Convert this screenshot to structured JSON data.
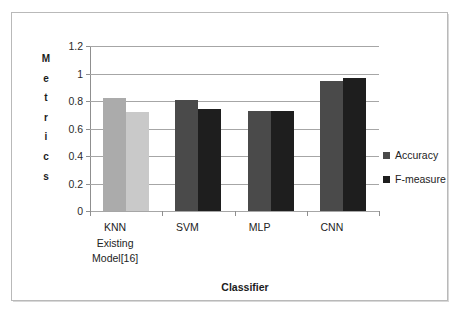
{
  "chart_data": {
    "type": "bar",
    "title": "",
    "xlabel": "Classifier",
    "ylabel": "Metrics",
    "categories": [
      "KNN\nExisting\nModel[16]",
      "SVM",
      "MLP",
      "CNN"
    ],
    "series": [
      {
        "name": "Accuracy",
        "values": [
          0.82,
          0.805,
          0.73,
          0.945
        ]
      },
      {
        "name": "F-measure",
        "values": [
          0.72,
          0.745,
          0.73,
          0.965
        ]
      }
    ],
    "ylim": [
      0,
      1.2
    ],
    "ytick_labels": [
      "0",
      "0.2",
      "0.4",
      "0.6",
      "0.8",
      "1",
      "1.2"
    ],
    "ytick_values": [
      0,
      0.2,
      0.4,
      0.6,
      0.8,
      1,
      1.2
    ],
    "grid": true,
    "legend_position": "right",
    "bar_colors": {
      "knn_accuracy": "#ABABAB",
      "knn_fmeasure": "#C9C9C9",
      "accuracy": "#4A4A4A",
      "fmeasure": "#1E1E1E"
    },
    "legend_swatch_colors": [
      "#4A4A4A",
      "#1E1E1E"
    ],
    "gridline_color": "#A6A6A6",
    "axis_color": "#8F8F8F",
    "frame_color": "#B9B9B9"
  },
  "axis": {
    "y_title_letters": [
      "M",
      "e",
      "t",
      "r",
      "i",
      "c",
      "s"
    ],
    "x_title": "Classifier"
  }
}
